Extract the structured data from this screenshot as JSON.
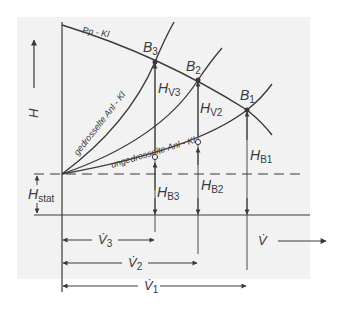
{
  "diagram": {
    "axis_labels": {
      "y": "H",
      "x": "V̇"
    },
    "curves": {
      "pump": "Pp - Kl",
      "throttled": "gedrosselte Anl - Kl",
      "unthrottled": "ungedrosselte Anl - Kl"
    },
    "points": {
      "b1": "B",
      "b1_sub": "1",
      "b2": "B",
      "b2_sub": "2",
      "b3": "B",
      "b3_sub": "3"
    },
    "heights": {
      "hv3": "H",
      "hv3_sub": "V3",
      "hv2": "H",
      "hv2_sub": "V2",
      "hb1": "H",
      "hb1_sub": "B1",
      "hb2": "H",
      "hb2_sub": "B2",
      "hb3": "H",
      "hb3_sub": "B3",
      "hstat": "H",
      "hstat_sub": "stat"
    },
    "flows": {
      "v3": "V̇",
      "v3_sub": "3",
      "v2": "V̇",
      "v2_sub": "2",
      "v1": "V̇",
      "v1_sub": "1"
    },
    "colors": {
      "background": "#f2f2f2",
      "ink": "#3a3a3a"
    }
  }
}
